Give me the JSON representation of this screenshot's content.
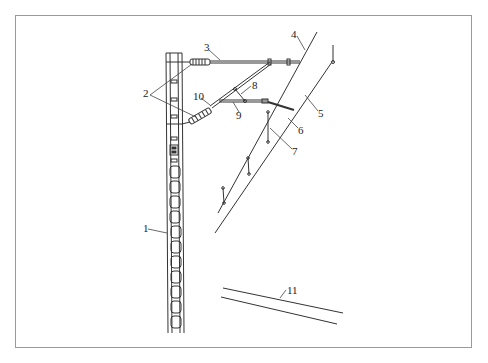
{
  "diagram": {
    "type": "overhead-catenary-cantilever-structure",
    "labels": [
      {
        "id": "1",
        "text": "1",
        "part": "pole (lattice support mast)",
        "x": 143,
        "y": 228
      },
      {
        "id": "2",
        "text": "2",
        "part": "insulators",
        "x": 143,
        "y": 91
      },
      {
        "id": "3",
        "text": "3",
        "part": "horizontal cantilever tube (stay tube)",
        "x": 204,
        "y": 44
      },
      {
        "id": "4",
        "text": "4",
        "part": "messenger / catenary wire",
        "x": 291,
        "y": 30
      },
      {
        "id": "5",
        "text": "5",
        "part": "contact wire",
        "x": 319,
        "y": 111
      },
      {
        "id": "6",
        "text": "6",
        "part": "steady arm (registration arm)",
        "x": 299,
        "y": 127
      },
      {
        "id": "7",
        "text": "7",
        "part": "dropper",
        "x": 294,
        "y": 148
      },
      {
        "id": "8",
        "text": "8",
        "part": "brace",
        "x": 252,
        "y": 83
      },
      {
        "id": "9",
        "text": "9",
        "part": "positioning tube",
        "x": 236,
        "y": 112
      },
      {
        "id": "10",
        "text": "10",
        "part": "inclined cantilever (bracket tube)",
        "x": 193,
        "y": 94
      },
      {
        "id": "11",
        "text": "11",
        "part": "rail / track",
        "x": 287,
        "y": 286
      }
    ],
    "colors": {
      "line": "#333333",
      "frame": "#9a9a9a",
      "background": "#ffffff"
    }
  }
}
